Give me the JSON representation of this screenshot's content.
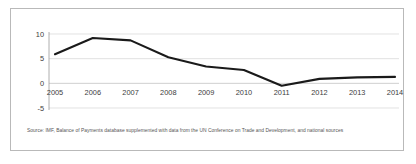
{
  "chart_data": {
    "type": "line",
    "title": "",
    "subtitle": "",
    "xlabel": "",
    "ylabel": "",
    "categories": [
      "2005",
      "2006",
      "2007",
      "2008",
      "2009",
      "2010",
      "2011",
      "2012",
      "2013",
      "2014"
    ],
    "values": [
      5.9,
      9.2,
      8.7,
      5.3,
      3.4,
      2.7,
      -0.5,
      0.9,
      1.2,
      1.3
    ],
    "series": [
      {
        "name": "",
        "values": [
          5.9,
          9.2,
          8.7,
          5.3,
          3.4,
          2.7,
          -0.5,
          0.9,
          1.2,
          1.3
        ]
      }
    ],
    "ylim": [
      -5,
      10
    ],
    "yticks": [
      10,
      5,
      0,
      -5
    ],
    "ytick_labels": [
      "10",
      "5",
      "0",
      "-5"
    ],
    "xtick_labels": [
      "2005",
      "2006",
      "2007",
      "2008",
      "2009",
      "2010",
      "2011",
      "2012",
      "2013",
      "2014"
    ],
    "grid": true,
    "legend": "none",
    "line_color": "#1a1a1a",
    "grid_color": "#d6d6d6",
    "axis_color": "#9a9a9a",
    "background": "#ffffff",
    "border_color": "#b9b9b9"
  },
  "source_note": "Source: IMF, Balance of Payments database supplemented with data from the UN Conference on Trade and Development, and national sources"
}
